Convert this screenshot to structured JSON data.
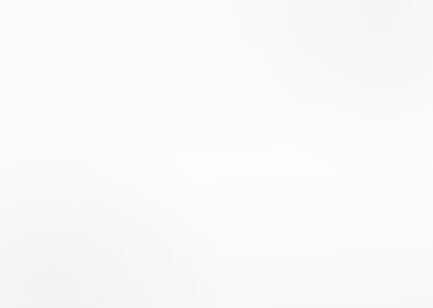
{
  "chart_data": {
    "type": "line",
    "title": "",
    "xlabel": "Year",
    "ylabel": "Population",
    "categories": [
      "1835",
      "1839-1840",
      "1843",
      "1848",
      "1868",
      "1882",
      "1891"
    ],
    "x_tick_positions": [
      75,
      98,
      120,
      152,
      273,
      367,
      410
    ],
    "ylim": [
      0,
      180000
    ],
    "y_ticks": [
      0,
      20000,
      40000,
      60000,
      80000,
      100000,
      120000,
      140000,
      160000,
      180000
    ],
    "y_tick_labels": [
      "0",
      "20,000",
      "40,000",
      "60,000",
      "80,000",
      "100,000",
      "120,000",
      "140,000",
      "160,000",
      "180,000"
    ],
    "grid": true,
    "legend_position": "bottom",
    "series": [
      {
        "name": "Libya",
        "marker": "small-circle",
        "line_style": "solid-thin",
        "points": [
          {
            "x": 75,
            "year": "1835",
            "value": 3500
          },
          {
            "x": 98,
            "year": "1839-1840",
            "value": 4000
          },
          {
            "x": 120,
            "year": "1843",
            "value": 1000
          },
          {
            "x": 410,
            "year": "1891",
            "value": 3000
          }
        ]
      },
      {
        "name": "Algeria",
        "marker": "large-diamond",
        "line_style": "solid-thick",
        "points": [
          {
            "x": 75,
            "year": "1835",
            "value": 3500
          },
          {
            "x": 98,
            "year": "1839-1840",
            "value": 4000
          },
          {
            "x": 120,
            "year": "1843",
            "value": 1000
          },
          {
            "x": 135,
            "year": "",
            "value": 3000
          },
          {
            "x": 143,
            "year": "",
            "value": 10000
          },
          {
            "x": 152,
            "year": "1848",
            "value": 500
          },
          {
            "x": 160,
            "year": "",
            "value": 19000
          },
          {
            "x": 273,
            "year": "1868",
            "value": 19000
          },
          {
            "x": 367,
            "year": "1882",
            "value": 19000
          },
          {
            "x": 410,
            "year": "1891",
            "value": 6000
          }
        ]
      },
      {
        "name": "Egypt",
        "marker": "small-open-circle",
        "line_style": "dashed",
        "points": [
          {
            "x": 152,
            "year": "1848",
            "value": 55000
          },
          {
            "x": 277,
            "year": "1868",
            "value": 172000
          }
        ]
      }
    ]
  },
  "legend": {
    "entries": [
      {
        "label": "Libya"
      },
      {
        "label": "Algeria"
      },
      {
        "label": "Egypt"
      }
    ]
  }
}
